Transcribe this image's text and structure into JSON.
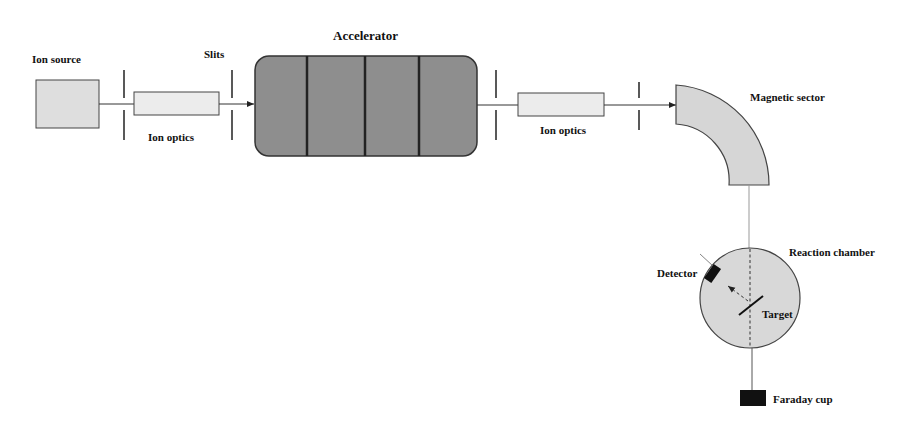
{
  "diagram": {
    "type": "schematic",
    "labels": {
      "ion_source": "Ion source",
      "slits": "Slits",
      "ion_optics_1": "Ion optics",
      "accelerator": "Accelerator",
      "ion_optics_2": "Ion optics",
      "magnetic_sector": "Magnetic sector",
      "reaction_chamber": "Reaction chamber",
      "detector": "Detector",
      "target": "Target",
      "faraday_cup": "Faraday cup"
    },
    "colors": {
      "stroke": "#333333",
      "light_fill": "#dcdcdc",
      "accelerator_fill": "#8c8c8c",
      "dark_fill": "#111111"
    },
    "flow": [
      "Ion source",
      "Slits",
      "Ion optics",
      "Accelerator",
      "Ion optics",
      "Magnetic sector",
      "Reaction chamber",
      "Faraday cup"
    ]
  }
}
